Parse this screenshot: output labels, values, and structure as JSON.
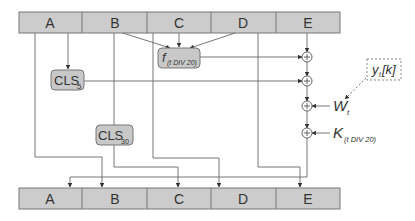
{
  "diagram": {
    "top_registers": [
      "A",
      "B",
      "C",
      "D",
      "E"
    ],
    "bottom_registers": [
      "A",
      "B",
      "C",
      "D",
      "E"
    ],
    "function_box": {
      "main": "f",
      "subscript": "(t DIV 20)"
    },
    "shift_boxes": [
      {
        "main": "CLS",
        "subscript": "5"
      },
      {
        "main": "CLS",
        "subscript": "30"
      }
    ],
    "message_box": {
      "main": "y",
      "subscript": "t",
      "suffix": "[k]"
    },
    "inputs": [
      {
        "main": "W",
        "subscript": "t"
      },
      {
        "main": "K",
        "subscript": "(t DIV 20)"
      }
    ],
    "adder_symbol": "+",
    "colors": {
      "register_fill": "#cccccc",
      "register_stroke": "#777777",
      "box_fill": "#c8c8c8",
      "line": "#555555"
    }
  }
}
